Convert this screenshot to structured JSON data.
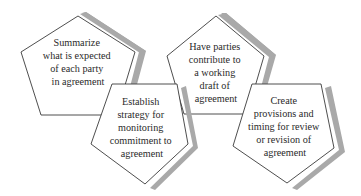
{
  "diagram": {
    "type": "pentagon-steps",
    "colors": {
      "shape_fill": "#ffffff",
      "shape_stroke": "#3a3a3a",
      "shadow": "#a9a9a9",
      "text": "#2a2a2a"
    },
    "steps": [
      {
        "id": "summarize",
        "orientation": "point-up",
        "lines": [
          "Summarize",
          "what is expected",
          "of each party",
          "in agreement"
        ]
      },
      {
        "id": "establish",
        "orientation": "point-down",
        "lines": [
          "Establish",
          "strategy for",
          "monitoring",
          "commitment to",
          "agreement"
        ]
      },
      {
        "id": "have-parties",
        "orientation": "point-up",
        "lines": [
          "Have parties",
          "contribute to",
          "a working",
          "draft of",
          "agreement"
        ]
      },
      {
        "id": "create",
        "orientation": "point-down",
        "lines": [
          "Create",
          "provisions and",
          "timing for review",
          "or revision of",
          "agreement"
        ]
      }
    ]
  }
}
